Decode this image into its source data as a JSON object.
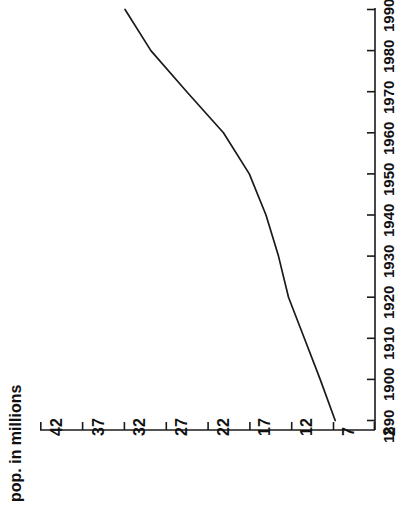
{
  "chart_data": {
    "type": "line",
    "title": "",
    "subtitle": "",
    "orientation": "rotated-90ccw",
    "xlabel": "",
    "ylabel": "pop. in millions",
    "grid": false,
    "legend": false,
    "legend_position": "none",
    "line_color": "#1a1a1a",
    "x": [
      1890,
      1900,
      1910,
      1920,
      1930,
      1940,
      1950,
      1960,
      1970,
      1980,
      1990
    ],
    "xlim": [
      1890,
      1990
    ],
    "x_tick_labels": [
      "1890",
      "1900",
      "1910",
      "1920",
      "1930",
      "1940",
      "1950",
      "1960",
      "1970",
      "1980",
      "1990"
    ],
    "ylim": [
      2,
      42
    ],
    "y_tick_labels": [
      "2",
      "7",
      "12",
      "17",
      "22",
      "27",
      "32",
      "37",
      "42"
    ],
    "y_ticks": [
      2,
      7,
      12,
      17,
      22,
      27,
      32,
      37,
      42
    ],
    "series": [
      {
        "name": "pop. in millions",
        "values": [
          6.7,
          8.5,
          10.4,
          12.3,
          13.5,
          15.0,
          17.0,
          20.1,
          24.5,
          28.8,
          31.9
        ]
      }
    ]
  },
  "axes": {
    "value_axis": {
      "title": "pop. in millions",
      "tick_labels": [
        "42",
        "37",
        "32",
        "27",
        "22",
        "17",
        "12",
        "7",
        "2"
      ]
    },
    "year_axis": {
      "title": "",
      "tick_labels": [
        "1990",
        "1980",
        "1970",
        "1960",
        "1950",
        "1940",
        "1930",
        "1920",
        "1910",
        "1900",
        "1890"
      ]
    }
  },
  "style": {
    "axis_color": "#1a1a1a",
    "background": "#ffffff",
    "line_color": "#1a1a1a"
  }
}
